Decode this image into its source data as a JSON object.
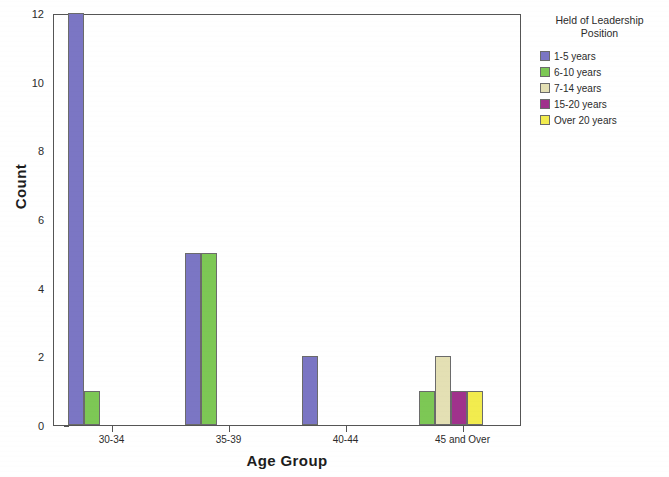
{
  "chart_data": {
    "type": "bar",
    "title": "",
    "xlabel": "Age Group",
    "ylabel": "Count",
    "categories": [
      "30-34",
      "35-39",
      "40-44",
      "45 and Over"
    ],
    "ylim": [
      0,
      12
    ],
    "yticks": [
      0,
      2,
      4,
      6,
      8,
      10,
      12
    ],
    "grid": false,
    "legend_position": "right",
    "legend_title": "Held of Leadership\nPosition",
    "series": [
      {
        "name": "1-5 years",
        "color": "#7b76c4",
        "values": [
          12,
          5,
          2,
          0
        ]
      },
      {
        "name": "6-10 years",
        "color": "#7dc855",
        "values": [
          1,
          5,
          0,
          1
        ]
      },
      {
        "name": "7-14 years",
        "color": "#e4e0b4",
        "values": [
          0,
          0,
          0,
          2
        ]
      },
      {
        "name": "15-20 years",
        "color": "#a0328c",
        "values": [
          0,
          0,
          0,
          1
        ]
      },
      {
        "name": "Over 20 years",
        "color": "#f2ec4e",
        "values": [
          0,
          0,
          0,
          1
        ]
      }
    ]
  },
  "axes": {
    "y_title": "Count",
    "x_title": "Age Group",
    "y_tick_labels": [
      "0",
      "2",
      "4",
      "6",
      "8",
      "10",
      "12"
    ],
    "x_tick_labels": [
      "30-34",
      "35-39",
      "40-44",
      "45 and Over"
    ]
  },
  "legend": {
    "title_line_1": "Held of Leadership",
    "title_line_2": "Position",
    "entries": [
      {
        "label": "1-5 years",
        "color": "#7b76c4"
      },
      {
        "label": "6-10 years",
        "color": "#7dc855"
      },
      {
        "label": "7-14 years",
        "color": "#e4e0b4"
      },
      {
        "label": "15-20 years",
        "color": "#a0328c"
      },
      {
        "label": "Over 20 years",
        "color": "#f2ec4e"
      }
    ]
  }
}
